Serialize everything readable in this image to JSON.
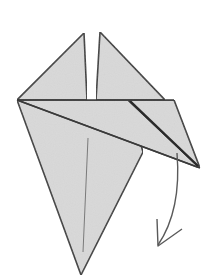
{
  "diagram": {
    "type": "origami-step",
    "colors": {
      "paper": "#d9d9d9",
      "outline": "#3a3a3a",
      "crease": "#7a7a7a",
      "arrow": "#5a5a5a",
      "background": "#ffffff"
    },
    "elements": [
      {
        "name": "left-upper-flap",
        "kind": "triangle"
      },
      {
        "name": "right-upper-flap",
        "kind": "triangle"
      },
      {
        "name": "kite-body",
        "kind": "polygon"
      },
      {
        "name": "folded-right-flap",
        "kind": "triangle"
      },
      {
        "name": "center-crease",
        "kind": "line"
      },
      {
        "name": "fold-down-arrow",
        "kind": "curved-arrow",
        "direction": "down"
      }
    ]
  }
}
